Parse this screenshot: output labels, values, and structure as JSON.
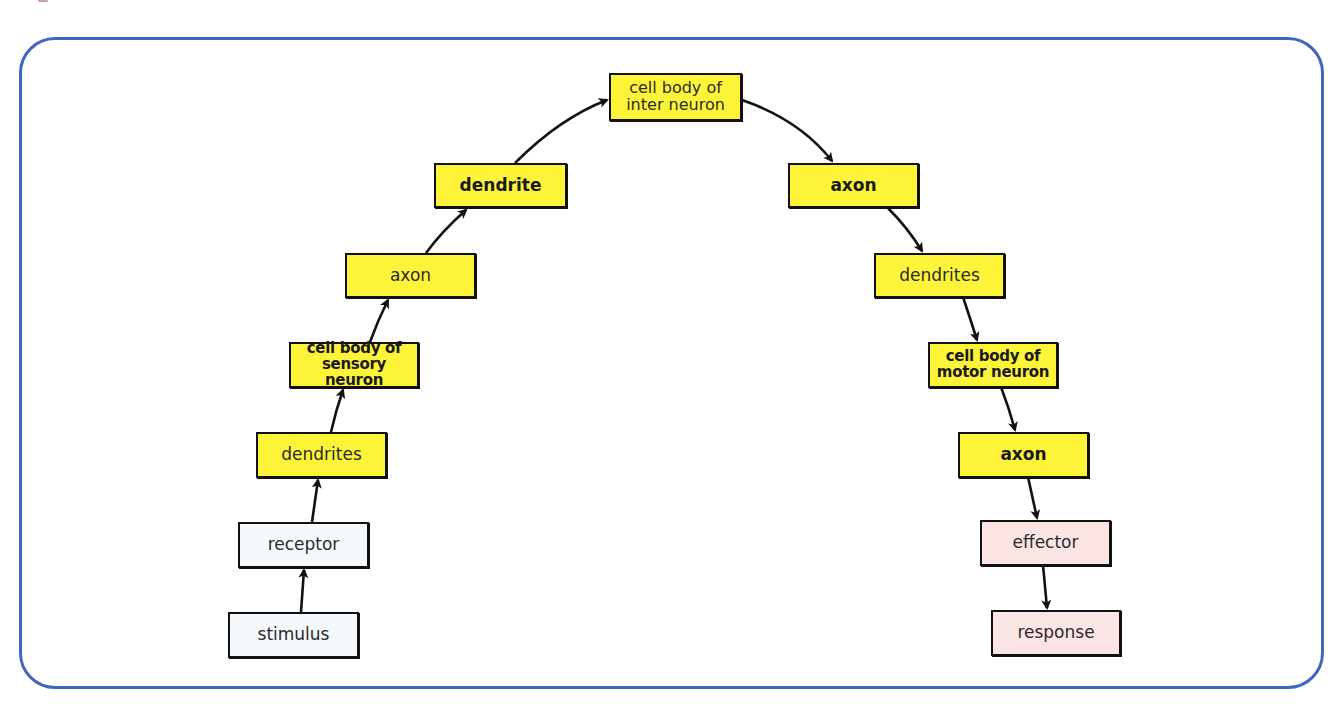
{
  "diagram": {
    "type": "reflex-arc flow",
    "colors": {
      "frame": "#3f66c2",
      "neuron_box": "#fdf43a",
      "input_box": "#f6f9fb",
      "output_box": "#fae4e4",
      "arrow": "#111111"
    },
    "nodes": {
      "stimulus": "stimulus",
      "receptor": "receptor",
      "dendrites_sensory": "dendrites",
      "cell_body_sensory": "cell body of\nsensory neuron",
      "axon_sensory": "axon",
      "dendrite_inter": "dendrite",
      "cell_body_inter": "cell body of\ninter neuron",
      "axon_inter": "axon",
      "dendrites_motor": "dendrites",
      "cell_body_motor": "cell body of\nmotor neuron",
      "axon_motor": "axon",
      "effector": "effector",
      "response": "response"
    },
    "edges": [
      [
        "stimulus",
        "receptor"
      ],
      [
        "receptor",
        "dendrites_sensory"
      ],
      [
        "dendrites_sensory",
        "cell_body_sensory"
      ],
      [
        "cell_body_sensory",
        "axon_sensory"
      ],
      [
        "axon_sensory",
        "dendrite_inter"
      ],
      [
        "dendrite_inter",
        "cell_body_inter"
      ],
      [
        "cell_body_inter",
        "axon_inter"
      ],
      [
        "axon_inter",
        "dendrites_motor"
      ],
      [
        "dendrites_motor",
        "cell_body_motor"
      ],
      [
        "cell_body_motor",
        "axon_motor"
      ],
      [
        "axon_motor",
        "effector"
      ],
      [
        "effector",
        "response"
      ]
    ]
  }
}
